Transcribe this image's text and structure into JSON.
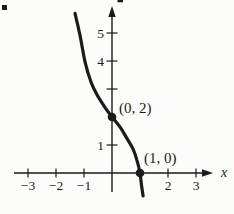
{
  "theme": {
    "background": "#fcfcfa",
    "ink": "#1b1b1b"
  },
  "chart_data": {
    "type": "line",
    "title": "",
    "xlabel": "x",
    "ylabel": "",
    "grid": false,
    "legend": false,
    "xlim": [
      -3.5,
      3.7
    ],
    "ylim": [
      -1.5,
      5.9
    ],
    "x_ticks": [
      {
        "value": -3,
        "label": "−3"
      },
      {
        "value": -2,
        "label": "−2"
      },
      {
        "value": -1,
        "label": "−1"
      },
      {
        "value": 2,
        "label": "2"
      },
      {
        "value": 3,
        "label": "3"
      }
    ],
    "y_ticks": [
      {
        "value": 1,
        "label": "1"
      },
      {
        "value": 3,
        "label": ""
      },
      {
        "value": 4,
        "label": "4"
      },
      {
        "value": 5,
        "label": "5"
      }
    ],
    "marked_points": [
      {
        "x": 0,
        "y": 2,
        "label": "(0, 2)",
        "label_dx": 7,
        "label_dy": -4
      },
      {
        "x": 1,
        "y": 0,
        "label": "(1, 0)",
        "label_dx": 4,
        "label_dy": -10
      }
    ],
    "series": [
      {
        "name": "curve",
        "points": [
          [
            -1.32,
            5.7
          ],
          [
            -1.14,
            4.9
          ],
          [
            -0.96,
            3.96
          ],
          [
            -0.75,
            3.25
          ],
          [
            -0.54,
            2.8
          ],
          [
            -0.29,
            2.4
          ],
          [
            0.0,
            2.0
          ],
          [
            0.29,
            1.64
          ],
          [
            0.5,
            1.29
          ],
          [
            0.75,
            0.86
          ],
          [
            0.89,
            0.46
          ],
          [
            1.0,
            0.0
          ],
          [
            1.05,
            -0.4
          ],
          [
            1.11,
            -0.82
          ]
        ]
      }
    ]
  }
}
